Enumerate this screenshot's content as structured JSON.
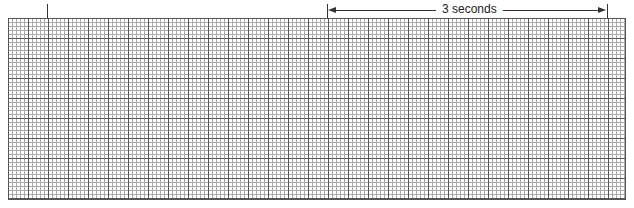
{
  "diagram": {
    "type": "ecg-rhythm-strip-grid",
    "grid": {
      "minor_cell_px": 4,
      "major_cell_px": 20,
      "minor_color": "#aaaaaa",
      "major_color": "#555555"
    },
    "markers": [
      {
        "name": "start-marker"
      },
      {
        "name": "interval-start-marker"
      },
      {
        "name": "interval-end-marker"
      }
    ],
    "interval": {
      "label": "3 seconds"
    }
  }
}
